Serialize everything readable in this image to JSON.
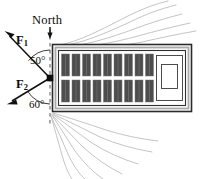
{
  "figure": {
    "background": "#ffffff",
    "width": 204,
    "height": 179
  },
  "labels": {
    "north": "North",
    "force1_symbol": "F",
    "force1_subscript": "1",
    "force2_symbol": "F",
    "force2_subscript": "2",
    "angle1": "50°",
    "angle2": "60°"
  },
  "colors": {
    "ink": "#111111",
    "container_fill": "#4d4d4d",
    "container_edge": "#6e6e6e",
    "hull_fill": "#ffffff",
    "hull_edge": "#2b2b2b",
    "deck_band": "#b3b3b3",
    "wake": "#b9b9b9",
    "dash_guide": "#6a6a6a"
  },
  "diagram_data": {
    "type": "free-body-diagram",
    "reference_direction": "North",
    "north_axis": {
      "x": 50,
      "y_top": 30,
      "y_bottom": 124,
      "style": "dashed"
    },
    "origin": {
      "x": 50,
      "y": 78,
      "marker": "filled-square"
    },
    "vectors": [
      {
        "name": "F1",
        "label": "F₁",
        "angle_from_north_deg": 50,
        "side": "west",
        "tip": {
          "x": 4,
          "y": 34
        },
        "tail": {
          "x": 50,
          "y": 78
        }
      },
      {
        "name": "F2",
        "label": "F₂",
        "angle_from_north_deg": 60,
        "side": "west",
        "tip": {
          "x": 7,
          "y": 104
        },
        "tail": {
          "x": 50,
          "y": 78
        }
      }
    ],
    "angle_arcs": [
      {
        "label": "50°",
        "between": [
          "North",
          "F1"
        ],
        "value_deg": 50
      },
      {
        "label": "60°",
        "between": [
          "North",
          "F2"
        ],
        "value_deg": 60
      }
    ],
    "object": {
      "name": "barge",
      "orientation": "horizontal",
      "hull": {
        "x": 52,
        "y": 44,
        "width": 140,
        "height": 68
      },
      "container_rows": 2,
      "containers_per_row": 10,
      "deckhouse": {
        "nested_rectangles": 2
      }
    },
    "wake": {
      "top_lines": 5,
      "bottom_lines": 7,
      "origin_side": "west"
    }
  }
}
